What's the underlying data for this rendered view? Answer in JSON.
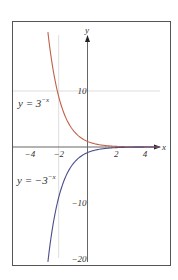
{
  "chart_data": {
    "type": "line",
    "title": "",
    "xlabel": "x",
    "ylabel": "y",
    "xlim": [
      -5.2,
      5.7
    ],
    "ylim": [
      -21.5,
      22.5
    ],
    "x_ticks": [
      -4,
      -2,
      2,
      4
    ],
    "x_tick_labels": [
      "−4",
      "−2",
      "2",
      "4"
    ],
    "y_ticks": [
      10,
      -10,
      -20
    ],
    "y_tick_labels": [
      "10",
      "−10",
      "−20"
    ],
    "grid": {
      "horizontal_at": [
        10
      ],
      "vertical_at": [
        -2
      ]
    },
    "legend": "inline annotations",
    "series": [
      {
        "name": "y = 3^{-x}",
        "label_main": "y = 3",
        "label_exp": "−x",
        "formula": "3^(-x)",
        "x_range": [
          -2.75,
          5
        ],
        "color": "#c0604a",
        "sample_x": [
          -2.75,
          -2,
          -1,
          0,
          1,
          2,
          3,
          4,
          5
        ],
        "sample_y": [
          20.5,
          9,
          3,
          1,
          0.333,
          0.111,
          0.037,
          0.012,
          0.004
        ]
      },
      {
        "name": "y = -3^{-x}",
        "label_main": "y = −3",
        "label_exp": "−x",
        "formula": "-3^(-x)",
        "x_range": [
          -2.75,
          5
        ],
        "color": "#4a4f8a",
        "sample_x": [
          -2.75,
          -2,
          -1,
          0,
          1,
          2,
          3,
          4,
          5
        ],
        "sample_y": [
          -20.5,
          -9,
          -3,
          -1,
          -0.333,
          -0.111,
          -0.037,
          -0.012,
          -0.004
        ]
      }
    ]
  },
  "colors": {
    "frame": "#555555",
    "axis": "#666666",
    "grid": "#dddddd",
    "text": "#333333"
  }
}
